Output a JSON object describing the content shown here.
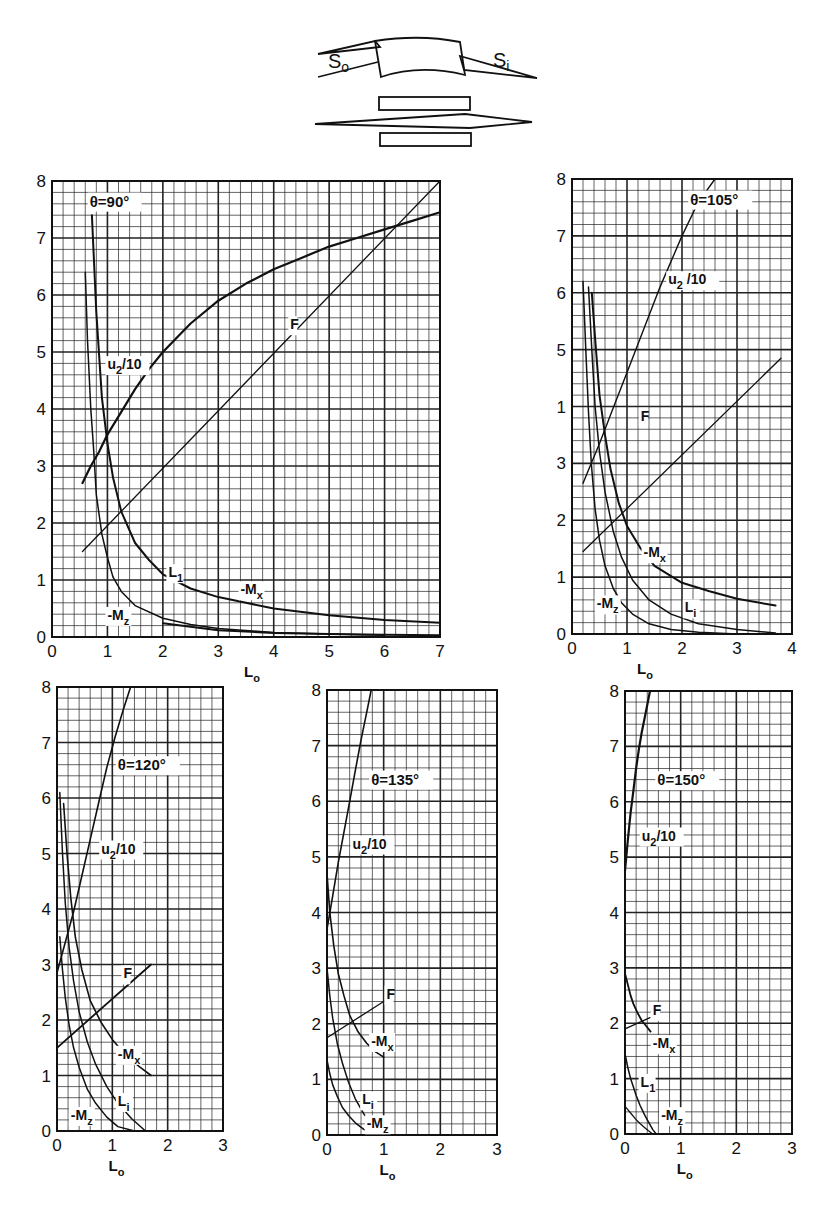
{
  "diagram": {
    "labels": {
      "left": "S",
      "left_sub": "o",
      "right": "S",
      "right_sub": "i"
    }
  },
  "chart_data": [
    {
      "type": "line",
      "id": "theta90",
      "title": "θ=90°",
      "xlabel": "L",
      "xlabel_sub": "o",
      "ylabel": "",
      "xlim": [
        0,
        7
      ],
      "ylim": [
        0,
        8
      ],
      "xticks": [
        0,
        1,
        2,
        3,
        4,
        5,
        6,
        7
      ],
      "yticks": [
        0,
        1,
        2,
        3,
        4,
        5,
        6,
        7,
        8
      ],
      "grid": true,
      "minor_per_major": 5,
      "frame_px": {
        "x0": 52,
        "x1": 440,
        "y0": 637,
        "y1": 181
      },
      "title_pos": [
        0.68,
        7.55
      ],
      "series": [
        {
          "name": "u2/10",
          "label": "u",
          "label_sub": "2",
          "label_tail": "/10",
          "label_at": [
            1.0,
            4.7
          ],
          "width": 2.2,
          "x": [
            0.55,
            0.7,
            0.85,
            1.0,
            1.25,
            1.5,
            1.75,
            2.0,
            2.5,
            3.0,
            3.5,
            4.0,
            4.5,
            5.0,
            5.5,
            6.0,
            6.5,
            7.0
          ],
          "y": [
            2.7,
            3.0,
            3.25,
            3.55,
            3.95,
            4.35,
            4.7,
            5.0,
            5.5,
            5.9,
            6.2,
            6.45,
            6.65,
            6.85,
            7.0,
            7.15,
            7.3,
            7.45
          ]
        },
        {
          "name": "F",
          "label": "F",
          "label_at": [
            4.3,
            5.4
          ],
          "width": 1.3,
          "x": [
            0.55,
            7.0
          ],
          "y": [
            1.5,
            8.0
          ]
        },
        {
          "name": "-Mx",
          "label": "-M",
          "label_sub": "x",
          "label_at": [
            3.4,
            0.75
          ],
          "width": 2.0,
          "x": [
            0.72,
            0.8,
            0.9,
            1.0,
            1.1,
            1.25,
            1.5,
            1.75,
            2.0,
            2.5,
            3.0,
            3.5,
            4.0,
            5.0,
            6.0,
            7.0
          ],
          "y": [
            7.4,
            5.7,
            4.2,
            3.4,
            2.8,
            2.2,
            1.65,
            1.35,
            1.1,
            0.85,
            0.7,
            0.6,
            0.5,
            0.38,
            0.3,
            0.25
          ]
        },
        {
          "name": "L1",
          "label": "L",
          "label_sub": "1",
          "label_at": [
            2.1,
            1.05
          ],
          "width": 1.5,
          "x": [
            0.6,
            0.64,
            0.7,
            0.75,
            0.8,
            0.9,
            1.0,
            1.1,
            1.25,
            1.5,
            2.0,
            2.5,
            3.0,
            4.0,
            5.0,
            6.0
          ],
          "y": [
            6.4,
            5.2,
            4.0,
            3.3,
            2.5,
            1.8,
            1.4,
            1.05,
            0.8,
            0.55,
            0.33,
            0.22,
            0.15,
            0.08,
            0.05,
            0.03
          ]
        },
        {
          "name": "-Mz",
          "label": "-M",
          "label_sub": "z",
          "label_at": [
            1.0,
            0.3
          ],
          "width": 2.0,
          "x": [
            2.0,
            3.0,
            4.0,
            5.0,
            6.0,
            7.0
          ],
          "y": [
            0.24,
            0.12,
            0.07,
            0.05,
            0.04,
            0.03
          ],
          "hidden_line": true
        }
      ]
    },
    {
      "type": "line",
      "id": "theta105",
      "title": "θ=105°",
      "xlabel": "L",
      "xlabel_sub": "o",
      "xlim": [
        0,
        4
      ],
      "ylim": [
        0,
        8
      ],
      "xticks": [
        0,
        1,
        2,
        3,
        4
      ],
      "yticks": [
        0,
        1,
        2,
        3,
        4,
        5,
        6,
        7,
        8
      ],
      "ytick_labels": [
        "0",
        "1",
        "2",
        "3",
        "1",
        "5",
        "6",
        "7",
        "8"
      ],
      "grid": true,
      "minor_per_major": 5,
      "frame_px": {
        "x0": 572,
        "x1": 792,
        "y0": 634,
        "y1": 179
      },
      "title_pos": [
        2.15,
        7.55
      ],
      "series": [
        {
          "name": "u2/10",
          "label": "u",
          "label_sub": "2",
          "label_tail": " /10",
          "label_at": [
            1.75,
            6.15
          ],
          "width": 1.4,
          "x": [
            0.2,
            0.5,
            0.8,
            1.0,
            1.3,
            1.6,
            2.0,
            2.3,
            2.6
          ],
          "y": [
            2.65,
            3.35,
            4.1,
            4.6,
            5.35,
            6.1,
            7.0,
            7.6,
            8.0
          ]
        },
        {
          "name": "F",
          "label": "F",
          "label_at": [
            1.25,
            3.75
          ],
          "width": 1.3,
          "x": [
            0.2,
            3.8
          ],
          "y": [
            1.45,
            4.85
          ]
        },
        {
          "name": "-Mx",
          "label": "-M",
          "label_sub": "x",
          "label_at": [
            1.3,
            1.35
          ],
          "width": 2.0,
          "x": [
            0.36,
            0.42,
            0.5,
            0.6,
            0.7,
            0.85,
            1.0,
            1.25,
            1.5,
            2.0,
            2.5,
            3.0,
            3.7
          ],
          "y": [
            6.0,
            5.2,
            4.2,
            3.5,
            2.9,
            2.3,
            1.9,
            1.5,
            1.2,
            0.9,
            0.75,
            0.62,
            0.5
          ]
        },
        {
          "name": "Li",
          "label": "L",
          "label_sub": "i",
          "label_at": [
            2.05,
            0.38
          ],
          "width": 1.5,
          "x": [
            0.3,
            0.36,
            0.42,
            0.5,
            0.6,
            0.75,
            0.9,
            1.1,
            1.4,
            1.8,
            2.3,
            3.0,
            3.7
          ],
          "y": [
            6.1,
            5.0,
            4.0,
            3.2,
            2.5,
            1.8,
            1.35,
            0.95,
            0.6,
            0.35,
            0.18,
            0.08,
            0.02
          ]
        },
        {
          "name": "-Mz",
          "label": "-M",
          "label_sub": "z",
          "label_at": [
            0.45,
            0.45
          ],
          "width": 1.5,
          "x": [
            0.2,
            0.25,
            0.3,
            0.35,
            0.42,
            0.5,
            0.6,
            0.75,
            0.9,
            1.1,
            1.4,
            1.8,
            2.3,
            3.0
          ],
          "y": [
            6.2,
            5.0,
            3.9,
            3.0,
            2.2,
            1.65,
            1.2,
            0.8,
            0.55,
            0.35,
            0.18,
            0.08,
            0.03,
            0.0
          ]
        }
      ]
    },
    {
      "type": "line",
      "id": "theta120",
      "title": "θ=120°",
      "xlabel": "L",
      "xlabel_sub": "o",
      "xlim": [
        0,
        3
      ],
      "ylim": [
        0,
        8
      ],
      "xticks": [
        0,
        1,
        2,
        3
      ],
      "yticks": [
        0,
        1,
        2,
        3,
        4,
        5,
        6,
        7,
        8
      ],
      "grid": true,
      "minor_per_major": 5,
      "frame_px": {
        "x0": 57,
        "x1": 223,
        "y0": 1131,
        "y1": 687
      },
      "title_pos": [
        1.1,
        6.5
      ],
      "series": [
        {
          "name": "u2/10",
          "label": "u",
          "label_sub": "2",
          "label_tail": "/10",
          "label_at": [
            0.8,
            5.0
          ],
          "width": 1.6,
          "x": [
            0.0,
            0.15,
            0.3,
            0.45,
            0.6,
            0.75,
            0.9,
            1.05,
            1.2,
            1.33
          ],
          "y": [
            2.85,
            3.4,
            3.95,
            4.6,
            5.25,
            5.9,
            6.55,
            7.1,
            7.6,
            8.0
          ]
        },
        {
          "name": "F",
          "label": "F",
          "label_at": [
            1.2,
            2.75
          ],
          "width": 1.8,
          "x": [
            0.0,
            1.7
          ],
          "y": [
            1.5,
            3.0
          ]
        },
        {
          "name": "-Mx",
          "label": "-M",
          "label_sub": "x",
          "label_at": [
            1.1,
            1.3
          ],
          "width": 1.6,
          "x": [
            0.12,
            0.18,
            0.25,
            0.33,
            0.45,
            0.6,
            0.8,
            1.0,
            1.25,
            1.5,
            1.7
          ],
          "y": [
            5.9,
            5.0,
            4.2,
            3.5,
            2.9,
            2.35,
            1.95,
            1.65,
            1.35,
            1.15,
            1.0
          ]
        },
        {
          "name": "Li",
          "label": "L",
          "label_sub": "i",
          "label_at": [
            1.1,
            0.45
          ],
          "width": 1.5,
          "x": [
            0.05,
            0.1,
            0.15,
            0.22,
            0.3,
            0.4,
            0.55,
            0.7,
            0.9,
            1.1,
            1.35,
            1.6
          ],
          "y": [
            6.1,
            5.0,
            4.1,
            3.3,
            2.7,
            2.15,
            1.6,
            1.2,
            0.8,
            0.5,
            0.22,
            0.0
          ]
        },
        {
          "name": "-Mz",
          "label": "-M",
          "label_sub": "z",
          "label_at": [
            0.25,
            0.2
          ],
          "width": 1.5,
          "x": [
            0.05,
            0.1,
            0.15,
            0.22,
            0.3,
            0.4,
            0.55,
            0.7,
            0.9,
            1.1,
            1.4
          ],
          "y": [
            3.5,
            2.9,
            2.4,
            1.9,
            1.5,
            1.15,
            0.75,
            0.5,
            0.25,
            0.08,
            0.0
          ]
        }
      ]
    },
    {
      "type": "line",
      "id": "theta135",
      "title": "θ=135°",
      "xlabel": "L",
      "xlabel_sub": "o",
      "xlim": [
        0,
        3
      ],
      "ylim": [
        0,
        8
      ],
      "xticks": [
        0,
        1,
        2,
        3
      ],
      "yticks": [
        0,
        1,
        2,
        3,
        4,
        5,
        6,
        7,
        8
      ],
      "grid": true,
      "minor_per_major": 5,
      "frame_px": {
        "x0": 327,
        "x1": 497,
        "y0": 1135,
        "y1": 690
      },
      "title_pos": [
        0.78,
        6.3
      ],
      "series": [
        {
          "name": "u2/10",
          "label": "u",
          "label_sub": "2",
          "label_tail": "/10",
          "label_at": [
            0.45,
            5.15
          ],
          "width": 1.6,
          "x": [
            0.0,
            0.1,
            0.2,
            0.3,
            0.4,
            0.5,
            0.6,
            0.7,
            0.78
          ],
          "y": [
            3.7,
            4.3,
            4.9,
            5.45,
            6.0,
            6.55,
            7.1,
            7.6,
            8.0
          ]
        },
        {
          "name": "F",
          "label": "F",
          "label_at": [
            1.05,
            2.45
          ],
          "width": 1.3,
          "x": [
            0.0,
            1.0
          ],
          "y": [
            1.75,
            2.4
          ]
        },
        {
          "name": "-Mx",
          "label": "-M",
          "label_sub": "x",
          "label_at": [
            0.78,
            1.6
          ],
          "width": 1.6,
          "x": [
            0.0,
            0.05,
            0.12,
            0.2,
            0.3,
            0.4,
            0.55,
            0.7,
            0.85,
            1.0
          ],
          "y": [
            4.7,
            4.0,
            3.4,
            2.9,
            2.5,
            2.15,
            1.85,
            1.65,
            1.5,
            1.4
          ]
        },
        {
          "name": "Li",
          "label": "L",
          "label_sub": "i",
          "label_at": [
            0.62,
            0.55
          ],
          "width": 1.5,
          "x": [
            0.0,
            0.05,
            0.1,
            0.18,
            0.27,
            0.38,
            0.5,
            0.65,
            0.8,
            0.95
          ],
          "y": [
            3.0,
            2.5,
            2.1,
            1.65,
            1.3,
            0.95,
            0.65,
            0.38,
            0.15,
            0.0
          ]
        },
        {
          "name": "-Mz",
          "label": "-M",
          "label_sub": "z",
          "label_at": [
            0.7,
            0.12
          ],
          "width": 1.5,
          "x": [
            0.0,
            0.05,
            0.1,
            0.18,
            0.27,
            0.38,
            0.5,
            0.65,
            0.8,
            0.9
          ],
          "y": [
            1.35,
            1.1,
            0.9,
            0.7,
            0.5,
            0.35,
            0.22,
            0.1,
            0.03,
            0.0
          ]
        }
      ]
    },
    {
      "type": "line",
      "id": "theta150",
      "title": "θ=150°",
      "xlabel": "L",
      "xlabel_sub": "o",
      "xlim": [
        0,
        3
      ],
      "ylim": [
        0,
        8
      ],
      "xticks": [
        0,
        1,
        2,
        3
      ],
      "yticks": [
        0,
        1,
        2,
        3,
        4,
        5,
        6,
        7,
        8
      ],
      "grid": true,
      "minor_per_major": 5,
      "frame_px": {
        "x0": 625,
        "x1": 792,
        "y0": 1134,
        "y1": 691
      },
      "title_pos": [
        0.58,
        6.3
      ],
      "series": [
        {
          "name": "u2/10",
          "label": "u",
          "label_sub": "2",
          "label_tail": "/10",
          "label_at": [
            0.3,
            5.3
          ],
          "width": 2.2,
          "x": [
            0.0,
            0.05,
            0.1,
            0.15,
            0.2,
            0.25,
            0.3,
            0.35,
            0.4,
            0.45
          ],
          "y": [
            4.75,
            5.3,
            5.8,
            6.2,
            6.6,
            6.95,
            7.25,
            7.5,
            7.75,
            8.0
          ]
        },
        {
          "name": "F",
          "label": "F",
          "label_at": [
            0.5,
            2.15
          ],
          "width": 1.3,
          "x": [
            0.0,
            0.45
          ],
          "y": [
            1.9,
            2.1
          ]
        },
        {
          "name": "-Mx",
          "label": "-M",
          "label_sub": "x",
          "label_at": [
            0.5,
            1.55
          ],
          "width": 1.8,
          "x": [
            0.0,
            0.05,
            0.1,
            0.15,
            0.22,
            0.3,
            0.38,
            0.46
          ],
          "y": [
            2.9,
            2.7,
            2.5,
            2.35,
            2.2,
            2.05,
            1.95,
            1.85
          ]
        },
        {
          "name": "L1",
          "label": "L",
          "label_sub": "1",
          "label_at": [
            0.28,
            0.85
          ],
          "width": 1.5,
          "x": [
            0.0,
            0.05,
            0.1,
            0.15,
            0.2,
            0.27,
            0.35,
            0.42,
            0.5,
            0.56
          ],
          "y": [
            1.45,
            1.2,
            1.0,
            0.85,
            0.7,
            0.52,
            0.35,
            0.22,
            0.08,
            0.0
          ]
        },
        {
          "name": "-Mz",
          "label": "-M",
          "label_sub": "z",
          "label_at": [
            0.65,
            0.25
          ],
          "width": 1.3,
          "x": [
            0.0,
            0.05,
            0.1,
            0.15,
            0.2,
            0.27,
            0.35,
            0.42,
            0.5
          ],
          "y": [
            0.5,
            0.44,
            0.38,
            0.32,
            0.26,
            0.19,
            0.12,
            0.06,
            0.0
          ]
        }
      ]
    }
  ]
}
